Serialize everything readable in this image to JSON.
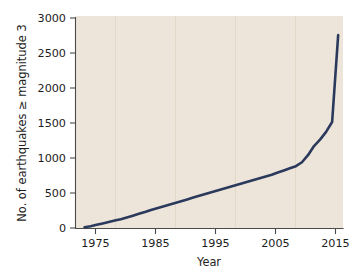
{
  "chart_data": {
    "type": "line",
    "title": "",
    "subtitle": "",
    "xlabel": "Year",
    "ylabel": "No. of earthquakes ≥ magnitude 3",
    "xlim": [
      1971.5,
      2015.8
    ],
    "ylim": [
      0,
      3000
    ],
    "xticks": [
      1975,
      1985,
      1995,
      2005,
      2015
    ],
    "xticklabels": [
      "1975",
      "1985",
      "1995",
      "2005",
      "2015"
    ],
    "yticks": [
      0,
      500,
      1000,
      1500,
      2000,
      2500,
      3000
    ],
    "yticklabels": [
      "0",
      "500",
      "1000",
      "1500",
      "2000",
      "2500",
      "3000"
    ],
    "grid": "vertical-only",
    "legend": "none",
    "plot_background": "#EDE5D9",
    "figure_background": "#FFFFFF",
    "line_color": "#2B3A5C",
    "line_width": 2.6,
    "series": [
      {
        "name": "Cumulative earthquakes ≥ magnitude 3",
        "x": [
          1973,
          1974,
          1975,
          1976,
          1977,
          1978,
          1979,
          1980,
          1981,
          1982,
          1983,
          1984,
          1985,
          1986,
          1987,
          1988,
          1989,
          1990,
          1991,
          1992,
          1993,
          1994,
          1995,
          1996,
          1997,
          1998,
          1999,
          2000,
          2001,
          2002,
          2003,
          2004,
          2005,
          2006,
          2007,
          2008,
          2009,
          2010,
          2011,
          2012,
          2013,
          2014,
          2015
        ],
        "values": [
          10,
          25,
          45,
          65,
          85,
          105,
          125,
          150,
          175,
          200,
          225,
          255,
          280,
          305,
          330,
          355,
          380,
          405,
          430,
          455,
          480,
          505,
          530,
          555,
          580,
          605,
          630,
          655,
          680,
          705,
          730,
          755,
          785,
          815,
          845,
          875,
          930,
          1030,
          1160,
          1250,
          1360,
          1500,
          2730
        ]
      }
    ],
    "annotations": []
  },
  "axes": {
    "y_title": "No. of earthquakes ≥ magnitude 3",
    "x_title": "Year",
    "y_tick_0": "0",
    "y_tick_500": "500",
    "y_tick_1000": "1000",
    "y_tick_1500": "1500",
    "y_tick_2000": "2000",
    "y_tick_2500": "2500",
    "y_tick_3000": "3000",
    "x_tick_1975": "1975",
    "x_tick_1985": "1985",
    "x_tick_1995": "1995",
    "x_tick_2005": "2005",
    "x_tick_2015": "2015"
  }
}
